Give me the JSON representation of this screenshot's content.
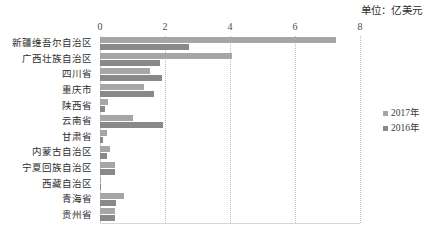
{
  "unit_caption": "单位：亿美元",
  "legend": {
    "position": "right-middle",
    "items": [
      {
        "label": "2017年",
        "color": "#a6a6a6"
      },
      {
        "label": "2016年",
        "color": "#898989"
      }
    ]
  },
  "axis": {
    "x_ticks": [
      "0",
      "2",
      "4",
      "6",
      "8"
    ],
    "x_min": 0,
    "x_max": 8
  },
  "chart_data": {
    "type": "bar",
    "orientation": "horizontal",
    "title": "",
    "subtitle": "",
    "xlabel": "",
    "ylabel": "",
    "unit": "亿美元",
    "xlim": [
      0,
      8
    ],
    "xticks": [
      0,
      2,
      4,
      6,
      8
    ],
    "grid": true,
    "legend_position": "right",
    "categories": [
      "新疆维吾尔自治区",
      "广西壮族自治区",
      "四川省",
      "重庆市",
      "陕西省",
      "云南省",
      "甘肃省",
      "内蒙古自治区",
      "宁夏回族自治区",
      "西藏自治区",
      "青海省",
      "贵州省"
    ],
    "series": [
      {
        "name": "2017年",
        "color": "#a6a6a6",
        "values": [
          7.25,
          4.05,
          1.55,
          1.35,
          0.25,
          1.0,
          0.2,
          0.3,
          0.45,
          0.02,
          0.75,
          0.45
        ]
      },
      {
        "name": "2016年",
        "color": "#898989",
        "values": [
          2.75,
          1.85,
          1.9,
          1.65,
          0.15,
          1.95,
          0.1,
          0.2,
          0.45,
          0.01,
          0.5,
          0.45
        ]
      }
    ]
  }
}
